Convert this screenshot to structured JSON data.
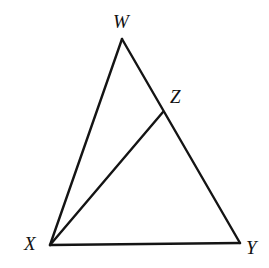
{
  "figure": {
    "type": "geometry-diagram",
    "canvas": {
      "width": 269,
      "height": 268,
      "background": "#ffffff"
    },
    "stroke_color": "#141414",
    "stroke_width": 2.4,
    "label_color": "#121212",
    "points": {
      "W": {
        "label": "W",
        "x": 122,
        "y": 39,
        "label_x": 113,
        "label_y": 12,
        "role": "apex-vertex"
      },
      "X": {
        "label": "X",
        "x": 50,
        "y": 245,
        "label_x": 24,
        "label_y": 234,
        "role": "bottom-left-vertex"
      },
      "Y": {
        "label": "Y",
        "x": 240,
        "y": 243,
        "label_x": 246,
        "label_y": 238,
        "role": "bottom-right-vertex"
      },
      "Z": {
        "label": "Z",
        "x": 163,
        "y": 112,
        "label_x": 170,
        "label_y": 87,
        "role": "point-on-side-WY"
      }
    },
    "segments": [
      {
        "name": "segment-WX",
        "from": "W",
        "to": "X",
        "path": "M122,39 L50,245"
      },
      {
        "name": "segment-WY",
        "from": "W",
        "to": "Y",
        "path": "M122,39 L240,243"
      },
      {
        "name": "segment-XY",
        "from": "X",
        "to": "Y",
        "path": "M50,245 L240,243"
      },
      {
        "name": "segment-XZ",
        "from": "X",
        "to": "Z",
        "path": "M50,245 L163,112"
      }
    ]
  }
}
